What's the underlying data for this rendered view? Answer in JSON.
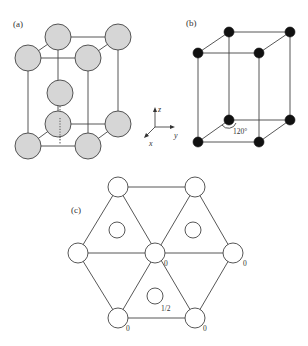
{
  "panels": {
    "a": {
      "label": "(a)",
      "atom_fill": "#d6d6d6",
      "atom_count": 9
    },
    "b": {
      "label": "(b)",
      "atom_fill": "#111111",
      "angle_label": "120°",
      "atom_count": 8
    },
    "c": {
      "label": "(c)",
      "height_labels": {
        "center": "0",
        "right": "0",
        "bottom_left": "0",
        "bottom_right": "0",
        "interior_bottom": "1/2"
      }
    }
  },
  "axes": {
    "x": "x",
    "y": "y",
    "z": "z"
  },
  "colors": {
    "line": "#444444",
    "text": "#333333",
    "background": "#ffffff"
  }
}
